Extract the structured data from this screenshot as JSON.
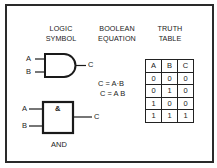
{
  "headings": {
    "logic_symbol": [
      "LOGIC",
      "SYMBOL"
    ],
    "boolean_equation": [
      "BOOLEAN",
      "EQUATION"
    ],
    "truth_table": [
      "TRUTH",
      "TABLE"
    ]
  },
  "gate_distinctive": {
    "inputs": [
      "A",
      "B"
    ],
    "output": "C"
  },
  "gate_rectangular": {
    "symbol": "&",
    "inputs": [
      "A",
      "B"
    ],
    "output": "C",
    "name": "AND"
  },
  "equations": [
    "C = A·B",
    "C = A B"
  ],
  "truth_table": {
    "headers": [
      "A",
      "B",
      "C"
    ],
    "rows": [
      [
        "0",
        "0",
        "0"
      ],
      [
        "0",
        "1",
        "0"
      ],
      [
        "1",
        "0",
        "0"
      ],
      [
        "1",
        "1",
        "1"
      ]
    ]
  }
}
